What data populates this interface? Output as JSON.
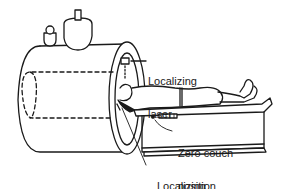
{
  "diagram": {
    "labels": {
      "top_laser": [
        "Localizing",
        "laser"
      ],
      "zero_couch": [
        "Zero couch",
        "position"
      ],
      "bottom_laser": [
        "Localizing",
        "laser"
      ]
    },
    "colors": {
      "line": "#1a1a1a",
      "background": "#ffffff"
    }
  }
}
